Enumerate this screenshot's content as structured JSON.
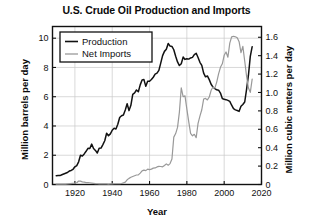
{
  "chart_data": {
    "type": "line",
    "title": "U.S. Crude Oil Production and Imports",
    "xlabel": "Year",
    "ylabel": "Million barrels per day",
    "ylabel_right": "Million cubic meters per day",
    "xlim": [
      1908,
      2020
    ],
    "ylim": [
      0,
      10.8
    ],
    "ylim_right": [
      0,
      1.717
    ],
    "grid": true,
    "legend_position": "top-left",
    "xticks": [
      1920,
      1940,
      1960,
      1980,
      2000,
      2020
    ],
    "xtick_labels": [
      "1920",
      "1940",
      "1960",
      "1980",
      "2000",
      "2020"
    ],
    "yticks": [
      0,
      2,
      4,
      6,
      8,
      10
    ],
    "ytick_labels": [
      "0",
      "2",
      "4",
      "6",
      "8",
      "10"
    ],
    "yticks_right": [
      0,
      0.2,
      0.4,
      0.6,
      0.8,
      1.0,
      1.2,
      1.4,
      1.6
    ],
    "ytick_labels_right": [
      "0",
      "0.2",
      "0.4",
      "0.6",
      "0.8",
      "1.0",
      "1.2",
      "1.4",
      "1.6"
    ],
    "series": [
      {
        "name": "Production",
        "color": "#111111",
        "x": [
          1910,
          1911,
          1912,
          1913,
          1914,
          1915,
          1916,
          1917,
          1918,
          1919,
          1920,
          1921,
          1922,
          1923,
          1924,
          1925,
          1926,
          1927,
          1928,
          1929,
          1930,
          1931,
          1932,
          1933,
          1934,
          1935,
          1936,
          1937,
          1938,
          1939,
          1940,
          1941,
          1942,
          1943,
          1944,
          1945,
          1946,
          1947,
          1948,
          1949,
          1950,
          1951,
          1952,
          1953,
          1954,
          1955,
          1956,
          1957,
          1958,
          1959,
          1960,
          1961,
          1962,
          1963,
          1964,
          1965,
          1966,
          1967,
          1968,
          1969,
          1970,
          1971,
          1972,
          1973,
          1974,
          1975,
          1976,
          1977,
          1978,
          1979,
          1980,
          1981,
          1982,
          1983,
          1984,
          1985,
          1986,
          1987,
          1988,
          1989,
          1990,
          1991,
          1992,
          1993,
          1994,
          1995,
          1996,
          1997,
          1998,
          1999,
          2000,
          2001,
          2002,
          2003,
          2004,
          2005,
          2006,
          2007,
          2008,
          2009,
          2010,
          2011,
          2012,
          2013,
          2014,
          2015
        ],
        "values": [
          0.6,
          0.61,
          0.61,
          0.67,
          0.72,
          0.77,
          0.82,
          0.92,
          0.96,
          1.04,
          1.21,
          1.29,
          1.55,
          2.0,
          1.95,
          2.09,
          2.27,
          2.47,
          2.46,
          2.76,
          2.46,
          2.33,
          2.15,
          2.48,
          2.49,
          2.73,
          2.99,
          3.5,
          3.33,
          3.46,
          3.71,
          3.84,
          3.8,
          4.12,
          4.58,
          4.7,
          4.75,
          5.09,
          5.52,
          5.05,
          5.41,
          6.16,
          6.26,
          6.46,
          6.34,
          6.81,
          7.15,
          7.17,
          6.71,
          7.05,
          7.06,
          7.18,
          7.33,
          7.54,
          7.61,
          7.8,
          8.3,
          8.81,
          9.1,
          9.24,
          9.64,
          9.46,
          9.44,
          9.21,
          8.77,
          8.38,
          8.13,
          8.25,
          8.71,
          8.55,
          8.6,
          8.57,
          8.65,
          8.69,
          8.88,
          8.97,
          8.68,
          8.35,
          8.14,
          7.61,
          7.36,
          7.42,
          7.17,
          6.85,
          6.66,
          6.56,
          6.47,
          6.45,
          6.25,
          5.88,
          5.82,
          5.8,
          5.75,
          5.68,
          5.42,
          5.18,
          5.1,
          5.06,
          5.0,
          5.35,
          5.47,
          5.64,
          6.5,
          7.47,
          8.76,
          9.42
        ]
      },
      {
        "name": "Net Imports",
        "color": "#999999",
        "x": [
          1910,
          1915,
          1920,
          1921,
          1922,
          1923,
          1924,
          1925,
          1926,
          1927,
          1928,
          1929,
          1930,
          1931,
          1932,
          1933,
          1934,
          1935,
          1936,
          1937,
          1938,
          1939,
          1940,
          1941,
          1942,
          1943,
          1944,
          1945,
          1946,
          1947,
          1948,
          1949,
          1950,
          1951,
          1952,
          1953,
          1954,
          1955,
          1956,
          1957,
          1958,
          1959,
          1960,
          1961,
          1962,
          1963,
          1964,
          1965,
          1966,
          1967,
          1968,
          1969,
          1970,
          1971,
          1972,
          1973,
          1974,
          1975,
          1976,
          1977,
          1978,
          1979,
          1980,
          1981,
          1982,
          1983,
          1984,
          1985,
          1986,
          1987,
          1988,
          1989,
          1990,
          1991,
          1992,
          1993,
          1994,
          1995,
          1996,
          1997,
          1998,
          1999,
          2000,
          2001,
          2002,
          2003,
          2004,
          2005,
          2006,
          2007,
          2008,
          2009,
          2010,
          2011,
          2012,
          2013,
          2014,
          2015
        ],
        "values": [
          0.02,
          0.03,
          0.1,
          0.12,
          0.24,
          0.23,
          0.18,
          0.16,
          0.13,
          0.13,
          0.12,
          0.1,
          0.08,
          0.06,
          0.05,
          0.04,
          0.04,
          0.04,
          0.04,
          0.04,
          0.03,
          0.04,
          0.04,
          0.05,
          0.05,
          0.05,
          0.05,
          0.07,
          0.11,
          0.16,
          0.32,
          0.42,
          0.49,
          0.55,
          0.6,
          0.65,
          0.66,
          0.78,
          0.93,
          0.98,
          0.95,
          1.05,
          1.02,
          1.05,
          1.12,
          1.13,
          1.2,
          1.24,
          1.23,
          1.21,
          1.3,
          1.41,
          1.32,
          1.43,
          1.74,
          3.24,
          3.48,
          3.9,
          4.95,
          6.61,
          6.0,
          6.06,
          5.15,
          4.3,
          3.49,
          3.33,
          3.43,
          3.2,
          4.18,
          4.67,
          5.11,
          5.84,
          5.89,
          5.78,
          5.98,
          6.44,
          6.66,
          6.59,
          7.0,
          7.56,
          8.01,
          8.25,
          8.83,
          9.06,
          8.7,
          9.66,
          10.09,
          10.13,
          10.1,
          10.03,
          9.76,
          9.01,
          9.44,
          8.44,
          7.4,
          6.59,
          6.3,
          7.2
        ]
      }
    ],
    "legend": [
      "Production",
      "Net Imports"
    ]
  },
  "legend": {
    "items": [
      {
        "label": "Production",
        "color": "#111111"
      },
      {
        "label": "Net Imports",
        "color": "#999999"
      }
    ]
  },
  "axes": {
    "title": "U.S. Crude Oil Production and Imports",
    "x_label": "Year",
    "y_label_left": "Million barrels per day",
    "y_label_right": "Million cubic meters per day"
  }
}
